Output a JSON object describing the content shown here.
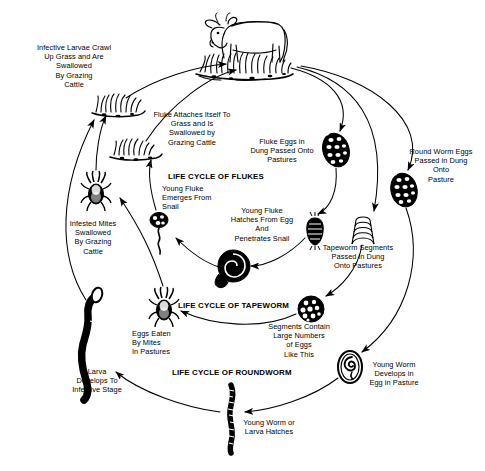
{
  "diagram": {
    "style": {
      "ink": "#000000",
      "background": "#ffffff",
      "stroke_width": 1.0
    },
    "headings": [
      {
        "id": "flukes",
        "text": "LIFE CYCLE OF FLUKES",
        "x": 168,
        "y": 172
      },
      {
        "id": "tapeworm",
        "text": "LIFE CYCLE OF TAPEWORM",
        "x": 178,
        "y": 301
      },
      {
        "id": "roundworm",
        "text": "LIFE CYCLE OF ROUNDWORM",
        "x": 172,
        "y": 368
      }
    ],
    "labels": [
      {
        "id": "infective-larvae-crawl",
        "text": "Infective Larvae Crawl\nUp Grass and Are\nSwallowed\nBy Grazing\nCattle",
        "x": 18,
        "y": 43,
        "w": 112,
        "align": "center"
      },
      {
        "id": "fluke-attaches-itself",
        "text": "Fluke Attaches Itself To\nGrass and Is\nSwallowed by\nGrazing Cattle",
        "x": 144,
        "y": 110,
        "w": 96,
        "align": "center"
      },
      {
        "id": "fluke-eggs-in-dung",
        "text": "Fluke Eggs in\nDung Passed Onto\nPastures",
        "x": 246,
        "y": 137,
        "w": 72,
        "align": "center"
      },
      {
        "id": "round-worm-eggs-passed",
        "text": "Round Worm Eggs\nPassed in Dung\nOnto\nPasture",
        "x": 400,
        "y": 147,
        "w": 82,
        "align": "center"
      },
      {
        "id": "young-fluke-emerges",
        "text": "Young Fluke\nEmerges From\nSnail",
        "x": 162,
        "y": 184,
        "w": 66,
        "align": "left"
      },
      {
        "id": "young-fluke-hatches",
        "text": "Young Fluke\nHatches From Egg\nAnd\nPenetrates Snail",
        "x": 226,
        "y": 206,
        "w": 72,
        "align": "center"
      },
      {
        "id": "infested-mites-swallowed",
        "text": "Infested Mites\nSwallowed\nBy Grazing\nCattle",
        "x": 62,
        "y": 219,
        "w": 62,
        "align": "center"
      },
      {
        "id": "tapeworm-segments-passed",
        "text": "Tapeworm Segments\nPassed in Dung\nOnto Pastures",
        "x": 316,
        "y": 243,
        "w": 84,
        "align": "center"
      },
      {
        "id": "segments-contain-eggs",
        "text": "Segments Contain\nLarge Numbers\nof Eggs\nLike This",
        "x": 262,
        "y": 322,
        "w": 74,
        "align": "center"
      },
      {
        "id": "eggs-eaten-by-mites",
        "text": "Eggs Eaten\nBy Mites\nIn Pastures",
        "x": 132,
        "y": 329,
        "w": 58,
        "align": "left"
      },
      {
        "id": "young-worm-develops",
        "text": "Young Worm\nDevelops in\nEgg in Pasture",
        "x": 363,
        "y": 360,
        "w": 62,
        "align": "center"
      },
      {
        "id": "larva-develops-infective",
        "text": "Larva\nDevelops To\nInfective Stage",
        "x": 66,
        "y": 367,
        "w": 62,
        "align": "center"
      },
      {
        "id": "young-worm-larva-hatches",
        "text": "Young Worm or\nLarva Hatches",
        "x": 236,
        "y": 418,
        "w": 66,
        "align": "center"
      }
    ],
    "icons": [
      {
        "id": "cow",
        "name": "cow-icon",
        "x": 210,
        "y": 12,
        "w": 80,
        "h": 52
      },
      {
        "id": "pasture-grass-cow",
        "name": "grass-tuft-icon",
        "x": 198,
        "y": 55,
        "w": 96,
        "h": 22
      },
      {
        "id": "grass-tuft-larvae",
        "name": "grass-tuft-icon",
        "x": 92,
        "y": 92,
        "w": 50,
        "h": 22
      },
      {
        "id": "grass-tuft-fluke",
        "name": "grass-tuft-icon",
        "x": 110,
        "y": 137,
        "w": 52,
        "h": 20
      },
      {
        "id": "mite-top",
        "name": "mite-icon",
        "x": 82,
        "y": 172,
        "w": 28,
        "h": 38
      },
      {
        "id": "fluke-egg",
        "name": "fluke-egg-icon",
        "x": 322,
        "y": 134,
        "w": 28,
        "h": 34
      },
      {
        "id": "roundworm-egg-dung",
        "name": "roundworm-egg-icon",
        "x": 390,
        "y": 174,
        "w": 28,
        "h": 34
      },
      {
        "id": "miracidium",
        "name": "fluke-miracidium-icon",
        "x": 306,
        "y": 218,
        "w": 18,
        "h": 28
      },
      {
        "id": "tapeworm-segment",
        "name": "tapeworm-segment-icon",
        "x": 350,
        "y": 218,
        "w": 26,
        "h": 26
      },
      {
        "id": "cercaria",
        "name": "young-fluke-icon",
        "x": 148,
        "y": 212,
        "w": 26,
        "h": 42
      },
      {
        "id": "snail",
        "name": "snail-icon",
        "x": 220,
        "y": 250,
        "w": 32,
        "h": 32
      },
      {
        "id": "mite-bottom",
        "name": "mite-icon",
        "x": 150,
        "y": 288,
        "w": 28,
        "h": 38
      },
      {
        "id": "tapeworm-egg-ball",
        "name": "tapeworm-egg-ball-icon",
        "x": 298,
        "y": 296,
        "w": 26,
        "h": 26
      },
      {
        "id": "roundworm-egg-larva",
        "name": "roundworm-egg-icon",
        "x": 338,
        "y": 350,
        "w": 24,
        "h": 34
      },
      {
        "id": "larva-infective",
        "name": "larva-icon",
        "x": 78,
        "y": 292,
        "w": 44,
        "h": 110
      },
      {
        "id": "young-worm",
        "name": "young-worm-icon",
        "x": 222,
        "y": 382,
        "w": 22,
        "h": 72
      }
    ],
    "flows": [
      {
        "id": "flow-fluke-eggs",
        "from": "pasture-grass-cow",
        "to": "fluke-egg"
      },
      {
        "id": "flow-tapeworm-seg",
        "from": "pasture-grass-cow",
        "to": "tapeworm-segment"
      },
      {
        "id": "flow-roundworm-eggs",
        "from": "pasture-grass-cow",
        "to": "roundworm-egg-dung"
      },
      {
        "id": "flow-egg-to-miracid",
        "from": "fluke-egg",
        "to": "miracidium"
      },
      {
        "id": "flow-miracid-to-snail",
        "from": "miracidium",
        "to": "snail"
      },
      {
        "id": "flow-snail-to-cerc",
        "from": "snail",
        "to": "cercaria"
      },
      {
        "id": "flow-cerc-to-grass",
        "from": "cercaria",
        "to": "grass-tuft-fluke"
      },
      {
        "id": "flow-grass-to-cow-f",
        "from": "grass-tuft-fluke",
        "to": "pasture-grass-cow"
      },
      {
        "id": "flow-seg-to-eggball",
        "from": "tapeworm-segment",
        "to": "tapeworm-egg-ball"
      },
      {
        "id": "flow-eggball-to-mite",
        "from": "tapeworm-egg-ball",
        "to": "mite-bottom"
      },
      {
        "id": "flow-mite-to-mitetop",
        "from": "mite-bottom",
        "to": "mite-top"
      },
      {
        "id": "flow-mitetop-to-grass",
        "from": "mite-top",
        "to": "grass-tuft-larvae"
      },
      {
        "id": "flow-rwegg-to-larvae",
        "from": "roundworm-egg-dung",
        "to": "roundworm-egg-larva"
      },
      {
        "id": "flow-rwlarva-to-worm",
        "from": "roundworm-egg-larva",
        "to": "young-worm"
      },
      {
        "id": "flow-worm-to-infect",
        "from": "young-worm",
        "to": "larva-infective"
      },
      {
        "id": "flow-infect-to-grass",
        "from": "larva-infective",
        "to": "grass-tuft-larvae"
      },
      {
        "id": "flow-grass-to-cow-r",
        "from": "grass-tuft-larvae",
        "to": "pasture-grass-cow"
      }
    ]
  }
}
